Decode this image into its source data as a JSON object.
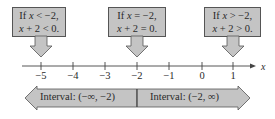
{
  "callouts": [
    {
      "line1_pre": "If ",
      "line1_var": "x",
      "line1_post": " < −2,",
      "line2_var": "x",
      "line2_post": " + 2 < 0.",
      "x_left": 12,
      "x_right": 65,
      "points_to": -5
    },
    {
      "line1_pre": "If ",
      "line1_var": "x",
      "line1_post": " = −2,",
      "line2_var": "x",
      "line2_post": " + 2 = 0.",
      "x_left": 108,
      "x_right": 166,
      "points_to": -2
    },
    {
      "line1_pre": "If ",
      "line1_var": "x",
      "line1_post": " > −2,",
      "line2_var": "x",
      "line2_post": " + 2 > 0.",
      "x_left": 204,
      "x_right": 261,
      "points_to": 1
    }
  ],
  "number_line": {
    "variable": "x",
    "ticks": [
      {
        "label": "−5",
        "x": 41
      },
      {
        "label": "−4",
        "x": 73
      },
      {
        "label": "−3",
        "x": 105
      },
      {
        "label": "−2",
        "x": 137
      },
      {
        "label": "−1",
        "x": 169
      },
      {
        "label": "0",
        "x": 202
      },
      {
        "label": "1",
        "x": 233
      }
    ]
  },
  "intervals": [
    {
      "label": "Interval: (−∞, −2)"
    },
    {
      "label": "Interval: (−2, ∞)"
    }
  ],
  "colors": {
    "fill": "#c4c4c4",
    "stroke": "#555555",
    "line": "#444444"
  }
}
